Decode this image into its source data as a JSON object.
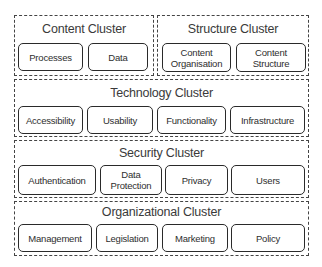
{
  "diagram": {
    "clusters": [
      {
        "id": "content",
        "title": "Content Cluster",
        "nodes": [
          {
            "label": "Processes"
          },
          {
            "label": "Data"
          }
        ]
      },
      {
        "id": "structure",
        "title": "Structure Cluster",
        "nodes": [
          {
            "line1": "Content",
            "line2": "Organisation"
          },
          {
            "line1": "Content",
            "line2": "Structure"
          }
        ]
      },
      {
        "id": "technology",
        "title": "Technology Cluster",
        "nodes": [
          {
            "label": "Accessibility"
          },
          {
            "label": "Usability"
          },
          {
            "label": "Functionality"
          },
          {
            "label": "Infrastructure"
          }
        ]
      },
      {
        "id": "security",
        "title": "Security Cluster",
        "nodes": [
          {
            "label": "Authentication"
          },
          {
            "line1": "Data",
            "line2": "Protection"
          },
          {
            "label": "Privacy"
          },
          {
            "label": "Users"
          }
        ]
      },
      {
        "id": "organizational",
        "title": "Organizational Cluster",
        "nodes": [
          {
            "label": "Management"
          },
          {
            "label": "Legislation"
          },
          {
            "label": "Marketing"
          },
          {
            "label": "Policy"
          }
        ]
      }
    ]
  }
}
